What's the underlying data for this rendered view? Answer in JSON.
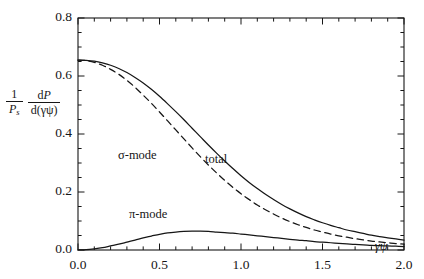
{
  "figure": {
    "background": "#ffffff",
    "ink": "#161616"
  },
  "axes": {
    "x": {
      "label_parts": {
        "gamma": "γ",
        "psi": "ψ"
      },
      "label": "γψ",
      "min": 0.0,
      "max": 2.0,
      "major_ticks": [
        0.0,
        0.5,
        1.0,
        1.5,
        2.0
      ],
      "major_tick_labels": [
        "0.0",
        "0.5",
        "1.0",
        "1.5",
        "2.0"
      ],
      "minor_tick_step": 0.1
    },
    "y": {
      "label": "(1/P_s) dP/d(γψ)",
      "label_parts": {
        "outer_num": "1",
        "outer_den_P": "P",
        "outer_den_sub": "s",
        "inner_num_d": "d",
        "inner_num_P": "P",
        "inner_den": "d(γψ)"
      },
      "min": 0.0,
      "max": 0.8,
      "major_ticks": [
        0.0,
        0.2,
        0.4,
        0.6,
        0.8
      ],
      "major_tick_labels": [
        "0.0",
        "0.2",
        "0.4",
        "0.6",
        "0.8"
      ],
      "minor_tick_step": 0.05
    },
    "frame": {
      "left": 78,
      "right": 404,
      "top": 18,
      "bottom": 250
    },
    "grid": false,
    "ticks_direction": "inward",
    "box": true
  },
  "annotations": [
    {
      "name": "sigma-mode-label",
      "text": "σ-mode",
      "x_px": 118,
      "y_px": 148
    },
    {
      "name": "total-label",
      "text": "total",
      "x_px": 205,
      "y_px": 152
    },
    {
      "name": "pi-mode-label",
      "text": "π-mode",
      "x_px": 129,
      "y_px": 207
    }
  ],
  "chart_data": {
    "type": "line",
    "title": "",
    "xlabel": "γψ",
    "ylabel": "(1/P_s) dP/d(γψ)",
    "xlim": [
      0.0,
      2.0
    ],
    "ylim": [
      0.0,
      0.8
    ],
    "grid": false,
    "legend": "inline-annotations",
    "x": [
      0.0,
      0.05,
      0.1,
      0.15,
      0.2,
      0.25,
      0.3,
      0.35,
      0.4,
      0.45,
      0.5,
      0.55,
      0.6,
      0.65,
      0.7,
      0.75,
      0.8,
      0.85,
      0.9,
      0.95,
      1.0,
      1.05,
      1.1,
      1.15,
      1.2,
      1.25,
      1.3,
      1.35,
      1.4,
      1.45,
      1.5,
      1.55,
      1.6,
      1.65,
      1.7,
      1.75,
      1.8,
      1.85,
      1.9,
      1.95,
      2.0
    ],
    "series": [
      {
        "name": "total",
        "style": "solid",
        "color": "#161616",
        "values": [
          0.655,
          0.654,
          0.651,
          0.645,
          0.637,
          0.626,
          0.612,
          0.595,
          0.576,
          0.554,
          0.53,
          0.504,
          0.477,
          0.449,
          0.42,
          0.391,
          0.362,
          0.334,
          0.307,
          0.281,
          0.256,
          0.233,
          0.212,
          0.192,
          0.174,
          0.157,
          0.142,
          0.128,
          0.115,
          0.104,
          0.094,
          0.085,
          0.077,
          0.069,
          0.063,
          0.057,
          0.051,
          0.046,
          0.042,
          0.038,
          0.034
        ]
      },
      {
        "name": "σ-mode",
        "style": "dashed",
        "color": "#161616",
        "values": [
          0.655,
          0.653,
          0.647,
          0.637,
          0.623,
          0.606,
          0.585,
          0.561,
          0.534,
          0.506,
          0.476,
          0.445,
          0.414,
          0.383,
          0.352,
          0.322,
          0.293,
          0.266,
          0.24,
          0.216,
          0.194,
          0.174,
          0.155,
          0.139,
          0.124,
          0.11,
          0.098,
          0.087,
          0.078,
          0.069,
          0.062,
          0.055,
          0.049,
          0.044,
          0.039,
          0.035,
          0.031,
          0.028,
          0.025,
          0.022,
          0.02
        ]
      },
      {
        "name": "π-mode",
        "style": "solid",
        "color": "#161616",
        "values": [
          0.0,
          0.001,
          0.004,
          0.008,
          0.014,
          0.02,
          0.027,
          0.034,
          0.042,
          0.048,
          0.054,
          0.059,
          0.062,
          0.064,
          0.065,
          0.065,
          0.064,
          0.062,
          0.06,
          0.058,
          0.055,
          0.052,
          0.049,
          0.046,
          0.043,
          0.04,
          0.037,
          0.034,
          0.032,
          0.029,
          0.027,
          0.025,
          0.023,
          0.021,
          0.019,
          0.018,
          0.016,
          0.015,
          0.014,
          0.013,
          0.012
        ]
      }
    ]
  }
}
